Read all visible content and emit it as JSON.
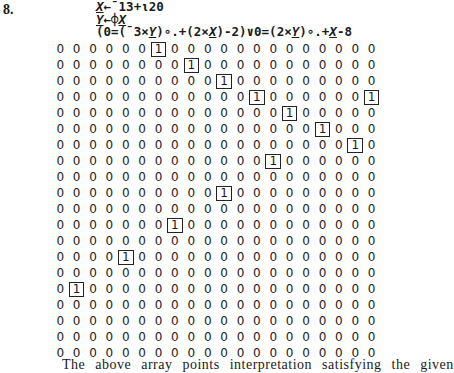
{
  "problem": {
    "number": "8."
  },
  "code": {
    "lines": [
      [
        {
          "t": "X",
          "var": true
        },
        {
          "t": "←¯13+⍳20",
          "var": false
        }
      ],
      [
        {
          "t": "Y",
          "var": true
        },
        {
          "t": "←⌽",
          "var": false
        },
        {
          "t": "X",
          "var": true
        }
      ],
      [
        {
          "t": "(0=(¯3×",
          "var": false
        },
        {
          "t": "Y",
          "var": true
        },
        {
          "t": ")∘.+(2×",
          "var": false
        },
        {
          "t": "X",
          "var": true
        },
        {
          "t": ")-2)∨0=(2×",
          "var": false
        },
        {
          "t": "Y",
          "var": true
        },
        {
          "t": ")∘.+",
          "var": false
        },
        {
          "t": "X",
          "var": true
        },
        {
          "t": "-8",
          "var": false
        }
      ]
    ]
  },
  "matrix": {
    "rows": 20,
    "cols": 20,
    "ones": [
      [
        7
      ],
      [
        9
      ],
      [
        11
      ],
      [
        13,
        20
      ],
      [
        15
      ],
      [
        17
      ],
      [
        19
      ],
      [
        14
      ],
      [],
      [
        11
      ],
      [],
      [
        8
      ],
      [],
      [
        5
      ],
      [],
      [
        2
      ],
      [],
      [],
      [],
      []
    ],
    "zero_glyph": "0",
    "one_glyph": "1"
  },
  "footer": {
    "text": "The above array points interpretation satisfying the given"
  }
}
